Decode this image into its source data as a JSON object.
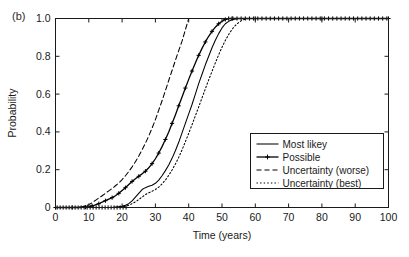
{
  "panel": {
    "label": "(b)"
  },
  "chart_data": {
    "type": "line",
    "title": "",
    "subtitle": "",
    "xlabel": "Time (years)",
    "ylabel": "Probability",
    "xlim": [
      0,
      100
    ],
    "ylim": [
      0,
      1.0
    ],
    "xticks": [
      0,
      10,
      20,
      30,
      40,
      50,
      60,
      70,
      80,
      90,
      100
    ],
    "xtick_labels": [
      "0",
      "10",
      "20",
      "30",
      "40",
      "50",
      "60",
      "70",
      "80",
      "90",
      "100"
    ],
    "yticks": [
      0,
      0.2,
      0.4,
      0.6,
      0.8,
      1.0
    ],
    "ytick_labels": [
      "0",
      "0.2",
      "0.4",
      "0.6",
      "0.8",
      "1.0"
    ],
    "grid": false,
    "legend_position": "lower-right",
    "series": [
      {
        "name": "Most likey",
        "style": "solid",
        "marker": "none",
        "color": "#000000",
        "x": [
          0,
          5,
          8,
          10,
          12,
          14,
          16,
          17,
          18,
          19,
          20,
          21,
          22,
          23,
          24,
          25,
          26,
          27,
          28,
          29,
          30,
          31,
          32,
          33,
          34,
          35,
          36,
          37,
          38,
          39,
          40,
          41,
          42,
          43,
          44,
          45,
          46,
          47,
          48,
          49,
          50,
          51,
          52,
          53,
          54,
          55,
          56,
          60,
          70,
          80,
          90,
          100
        ],
        "y": [
          0,
          0,
          0,
          0,
          0,
          0,
          0,
          0,
          0.002,
          0.004,
          0.006,
          0.012,
          0.02,
          0.035,
          0.055,
          0.075,
          0.095,
          0.105,
          0.112,
          0.118,
          0.128,
          0.145,
          0.168,
          0.195,
          0.225,
          0.26,
          0.3,
          0.345,
          0.395,
          0.445,
          0.495,
          0.545,
          0.6,
          0.655,
          0.705,
          0.755,
          0.8,
          0.845,
          0.885,
          0.92,
          0.95,
          0.972,
          0.985,
          0.993,
          0.998,
          1.0,
          1.0,
          1.0,
          1.0,
          1.0,
          1.0,
          1.0
        ]
      },
      {
        "name": "Possible",
        "style": "solid",
        "marker": "plus",
        "color": "#000000",
        "x": [
          0,
          3,
          5,
          7,
          9,
          10,
          11,
          12,
          13,
          14,
          15,
          16,
          17,
          18,
          19,
          20,
          21,
          22,
          23,
          24,
          25,
          26,
          27,
          28,
          29,
          30,
          31,
          32,
          33,
          34,
          35,
          36,
          37,
          38,
          39,
          40,
          41,
          42,
          43,
          44,
          45,
          46,
          47,
          48,
          49,
          50,
          51,
          52,
          53,
          56,
          60,
          70,
          80,
          90,
          100
        ],
        "y": [
          0,
          0,
          0,
          0,
          0.002,
          0.004,
          0.008,
          0.014,
          0.02,
          0.028,
          0.036,
          0.044,
          0.052,
          0.062,
          0.075,
          0.09,
          0.105,
          0.122,
          0.138,
          0.152,
          0.165,
          0.178,
          0.192,
          0.21,
          0.232,
          0.258,
          0.288,
          0.322,
          0.36,
          0.4,
          0.445,
          0.49,
          0.538,
          0.585,
          0.632,
          0.678,
          0.722,
          0.765,
          0.805,
          0.842,
          0.876,
          0.906,
          0.932,
          0.954,
          0.972,
          0.985,
          0.995,
          1.0,
          1.0,
          1.0,
          1.0,
          1.0,
          1.0,
          1.0,
          1.0
        ]
      },
      {
        "name": "Uncertainty (worse)",
        "style": "dashed",
        "marker": "none",
        "color": "#000000",
        "x": [
          0,
          3,
          5,
          7,
          8,
          9,
          10,
          11,
          12,
          13,
          14,
          15,
          16,
          17,
          18,
          19,
          20,
          21,
          22,
          23,
          24,
          25,
          26,
          27,
          28,
          29,
          30,
          31,
          32,
          33,
          34,
          35,
          36,
          37,
          38,
          39,
          40,
          50,
          60,
          70,
          80,
          90,
          100
        ],
        "y": [
          0,
          0,
          0,
          0.002,
          0.004,
          0.008,
          0.015,
          0.025,
          0.038,
          0.05,
          0.062,
          0.075,
          0.088,
          0.1,
          0.115,
          0.13,
          0.148,
          0.168,
          0.19,
          0.215,
          0.242,
          0.272,
          0.305,
          0.34,
          0.378,
          0.42,
          0.465,
          0.515,
          0.565,
          0.618,
          0.672,
          0.725,
          0.778,
          0.83,
          0.88,
          0.94,
          1.0,
          1.0,
          1.0,
          1.0,
          1.0,
          1.0,
          1.0
        ]
      },
      {
        "name": "Uncertainty (best)",
        "style": "dotted",
        "marker": "none",
        "color": "#000000",
        "x": [
          0,
          5,
          10,
          14,
          16,
          18,
          19,
          20,
          21,
          22,
          23,
          24,
          25,
          26,
          27,
          28,
          29,
          30,
          31,
          32,
          33,
          34,
          35,
          36,
          37,
          38,
          39,
          40,
          41,
          42,
          43,
          44,
          45,
          46,
          47,
          48,
          49,
          50,
          51,
          52,
          53,
          54,
          55,
          56,
          57,
          58,
          60,
          70,
          80,
          90,
          100
        ],
        "y": [
          0,
          0,
          0,
          0,
          0,
          0,
          0.001,
          0.003,
          0.006,
          0.012,
          0.02,
          0.03,
          0.042,
          0.055,
          0.068,
          0.078,
          0.086,
          0.095,
          0.108,
          0.125,
          0.145,
          0.17,
          0.198,
          0.23,
          0.265,
          0.305,
          0.348,
          0.392,
          0.438,
          0.485,
          0.532,
          0.58,
          0.628,
          0.675,
          0.72,
          0.765,
          0.808,
          0.848,
          0.884,
          0.915,
          0.942,
          0.963,
          0.979,
          0.99,
          0.997,
          1.0,
          1.0,
          1.0,
          1.0,
          1.0,
          1.0
        ]
      }
    ],
    "baseline_marker_series": "Possible",
    "top_marker_series": "Possible"
  },
  "legend": {
    "entries": [
      {
        "label": "Most likey"
      },
      {
        "label": "Possible"
      },
      {
        "label": "Uncertainty (worse)"
      },
      {
        "label": "Uncertainty (best)"
      }
    ]
  }
}
